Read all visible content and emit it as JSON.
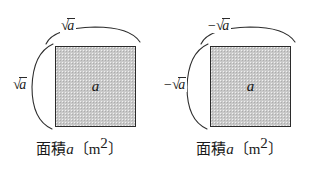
{
  "figure": {
    "background_color": "#ffffff",
    "stroke_color": "#2b2b2b",
    "square_fill_color": "#c9c9c9",
    "panels": [
      {
        "id": "left",
        "square_inner_label": "a",
        "top_dimension": {
          "sign": "",
          "radical": "√",
          "radicand": "a",
          "text": "√a"
        },
        "left_dimension": {
          "sign": "",
          "radical": "√",
          "radicand": "a",
          "text": "√a"
        },
        "caption": {
          "japanese": "面積",
          "variable": "a",
          "unit_open": "〔",
          "unit": "m",
          "unit_exponent": "2",
          "unit_close": "〕",
          "text": "面積a〔m2〕"
        }
      },
      {
        "id": "right",
        "square_inner_label": "a",
        "top_dimension": {
          "sign": "−",
          "radical": "√",
          "radicand": "a",
          "text": "−√a"
        },
        "left_dimension": {
          "sign": "−",
          "radical": "√",
          "radicand": "a",
          "text": "−√a"
        },
        "caption": {
          "japanese": "面積",
          "variable": "a",
          "unit_open": "〔",
          "unit": "m",
          "unit_exponent": "2",
          "unit_close": "〕",
          "text": "面積a〔m2〕"
        }
      }
    ]
  }
}
